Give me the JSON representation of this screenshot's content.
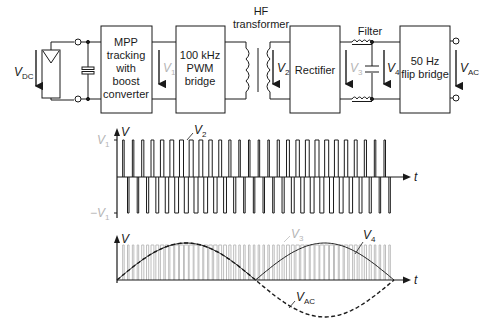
{
  "blocks": {
    "mpp": {
      "lines": [
        "MPP",
        "tracking",
        "with",
        "boost",
        "converter"
      ]
    },
    "pwm": {
      "lines": [
        "100 kHz",
        "PWM",
        "bridge"
      ]
    },
    "transformer": {
      "lines": [
        "HF",
        "transformer"
      ]
    },
    "rectifier": {
      "lines": [
        "Rectifier"
      ]
    },
    "filter": {
      "label": "Filter"
    },
    "flip": {
      "lines": [
        "50 Hz",
        "flip bridge"
      ]
    }
  },
  "voltages": {
    "vdc": {
      "main": "V",
      "sub": "DC"
    },
    "v1": {
      "main": "V",
      "sub": "1"
    },
    "v2": {
      "main": "V",
      "sub": "2"
    },
    "v3": {
      "main": "V",
      "sub": "3"
    },
    "v4": {
      "main": "V",
      "sub": "4"
    },
    "vac": {
      "main": "V",
      "sub": "AC"
    }
  },
  "colors": {
    "line": "#1a1a1a",
    "faded": "#b5b5b5",
    "background": "#ffffff"
  },
  "chart_data": [
    {
      "type": "line",
      "title": "",
      "ylabel": "V",
      "xlabel": "t",
      "ytick_labels": [
        "V1",
        "-V1"
      ],
      "series": [
        {
          "name": "V2",
          "description": "bipolar PWM square wave between +V1 and -V1; pulse widths grow from narrow to wide and back to narrow across each half period, two half periods shown"
        }
      ]
    },
    {
      "type": "line",
      "title": "",
      "ylabel": "V",
      "xlabel": "t",
      "series": [
        {
          "name": "V3",
          "description": "rectified unipolar PWM pulse train (faded gray)"
        },
        {
          "name": "V4",
          "description": "filtered rectified sine (full-wave, two positive humps)"
        },
        {
          "name": "VAC",
          "description": "dashed 50 Hz sine: positive first half, negative second half"
        }
      ]
    }
  ],
  "waveform1": {
    "axis_label": "V",
    "t_label": "t",
    "ytick_pos": {
      "main": "V",
      "sub": "1"
    },
    "ytick_neg": {
      "main": "−V",
      "sub": "1"
    },
    "series_label": {
      "main": "V",
      "sub": "2"
    }
  },
  "waveform2": {
    "axis_label": "V",
    "t_label": "t",
    "label_v3": {
      "main": "V",
      "sub": "3"
    },
    "label_v4": {
      "main": "V",
      "sub": "4"
    },
    "label_vac": {
      "main": "V",
      "sub": "AC"
    }
  }
}
